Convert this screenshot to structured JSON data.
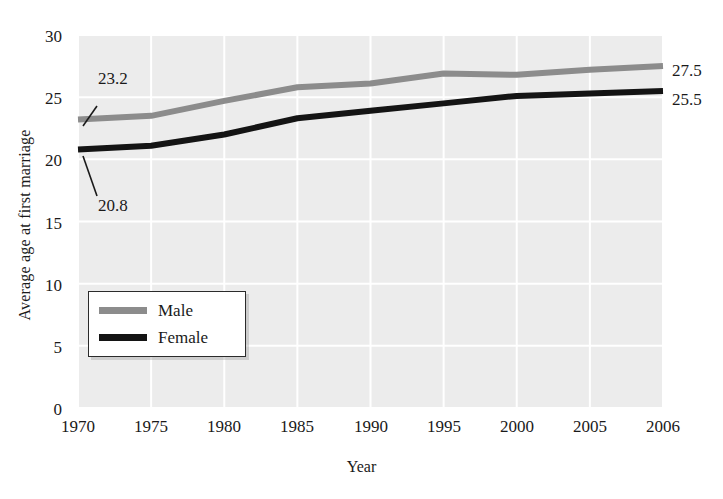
{
  "chart_data": {
    "type": "line",
    "title": "",
    "xlabel": "Year",
    "ylabel": "Average age at first marriage",
    "categories": [
      "1970",
      "1975",
      "1980",
      "1985",
      "1990",
      "1995",
      "2000",
      "2005",
      "2006"
    ],
    "ylim": [
      0,
      30
    ],
    "yticks": [
      "0",
      "5",
      "10",
      "15",
      "20",
      "25",
      "30"
    ],
    "grid": true,
    "legend_position": "lower-left-inside",
    "series": [
      {
        "name": "Male",
        "color": "#8c8c8c",
        "values": [
          23.2,
          23.5,
          24.7,
          25.8,
          26.1,
          26.9,
          26.8,
          27.2,
          27.5
        ],
        "start_label": "23.2",
        "end_label": "27.5"
      },
      {
        "name": "Female",
        "color": "#141414",
        "values": [
          20.8,
          21.1,
          22.0,
          23.3,
          23.9,
          24.5,
          25.1,
          25.3,
          25.5
        ],
        "start_label": "20.8",
        "end_label": "25.5"
      }
    ],
    "annotations": [
      {
        "text": "23.2",
        "series": "Male",
        "at": "1970",
        "placement": "above-left"
      },
      {
        "text": "20.8",
        "series": "Female",
        "at": "1970",
        "placement": "below-left"
      },
      {
        "text": "27.5",
        "series": "Male",
        "at": "2006",
        "placement": "right"
      },
      {
        "text": "25.5",
        "series": "Female",
        "at": "2006",
        "placement": "right"
      }
    ],
    "colors": {
      "male_line": "#8c8c8c",
      "female_line": "#141414",
      "plot_background": "#ececec",
      "gridline": "#ffffff",
      "text": "#1a1a1a"
    }
  }
}
